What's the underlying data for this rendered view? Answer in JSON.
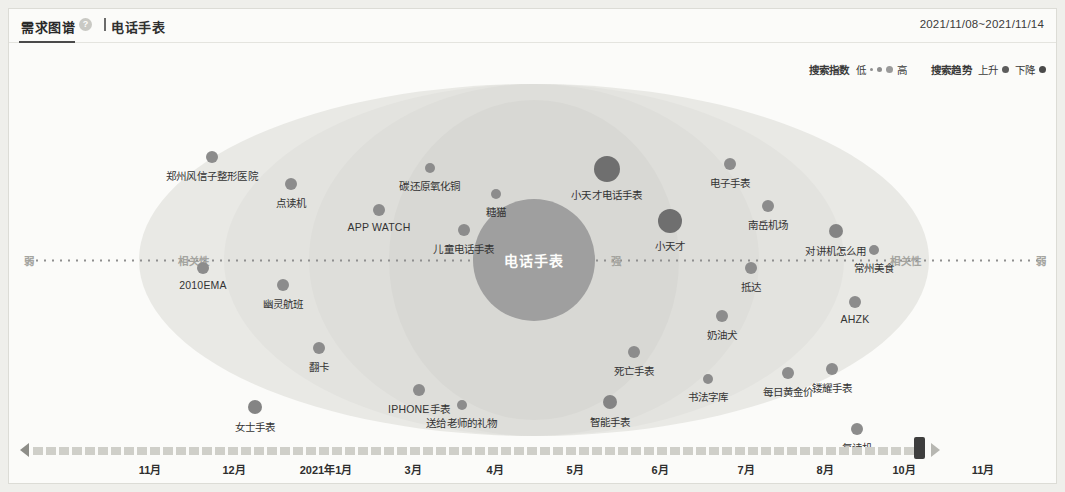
{
  "header": {
    "title": "需求图谱",
    "help_icon": "question-mark",
    "keyword": "电话手表",
    "date_range": "2021/11/08~2021/11/14"
  },
  "legend": {
    "index_title": "搜索指数",
    "index_low": "低",
    "index_high": "高",
    "trend_title": "搜索趋势",
    "trend_up": "上升",
    "trend_down": "下降"
  },
  "axis": {
    "weak_left": "弱",
    "relevance_left": "相关性",
    "strong_left": "强",
    "strong_right": "强",
    "relevance_right": "相关性",
    "weak_right": "弱"
  },
  "graph": {
    "center_label": "电话手表",
    "nodes": [
      {
        "label": "郑州风信子整形医院",
        "x": 203,
        "y": 148,
        "r": 6
      },
      {
        "label": "点读机",
        "x": 282,
        "y": 175,
        "r": 6
      },
      {
        "label": "APP WATCH",
        "x": 370,
        "y": 201,
        "r": 6
      },
      {
        "label": "碳还原氧化铜",
        "x": 421,
        "y": 159,
        "r": 5
      },
      {
        "label": "糖猫",
        "x": 487,
        "y": 185,
        "r": 5
      },
      {
        "label": "小天才电话手表",
        "x": 598,
        "y": 160,
        "r": 13
      },
      {
        "label": "电子手表",
        "x": 721,
        "y": 155,
        "r": 6
      },
      {
        "label": "儿童电话手表",
        "x": 455,
        "y": 221,
        "r": 6
      },
      {
        "label": "小天才",
        "x": 661,
        "y": 212,
        "r": 12
      },
      {
        "label": "南岳机场",
        "x": 759,
        "y": 197,
        "r": 6
      },
      {
        "label": "对讲机怎么用",
        "x": 827,
        "y": 222,
        "r": 7
      },
      {
        "label": "常州美食",
        "x": 865,
        "y": 241,
        "r": 5
      },
      {
        "label": "2010EMA",
        "x": 194,
        "y": 259,
        "r": 6
      },
      {
        "label": "抵达",
        "x": 742,
        "y": 259,
        "r": 6
      },
      {
        "label": "幽灵航班",
        "x": 274,
        "y": 276,
        "r": 6
      },
      {
        "label": "AHZK",
        "x": 846,
        "y": 293,
        "r": 6
      },
      {
        "label": "奶油犬",
        "x": 713,
        "y": 307,
        "r": 6
      },
      {
        "label": "翻卡",
        "x": 310,
        "y": 339,
        "r": 6
      },
      {
        "label": "死亡手表",
        "x": 625,
        "y": 343,
        "r": 6
      },
      {
        "label": "书法字库",
        "x": 699,
        "y": 370,
        "r": 5
      },
      {
        "label": "每日黄金价",
        "x": 779,
        "y": 364,
        "r": 6
      },
      {
        "label": "镂耀手表",
        "x": 823,
        "y": 360,
        "r": 6
      },
      {
        "label": "IPHONE手表",
        "x": 410,
        "y": 381,
        "r": 6
      },
      {
        "label": "送给老师的礼物",
        "x": 453,
        "y": 396,
        "r": 5
      },
      {
        "label": "女士手表",
        "x": 246,
        "y": 398,
        "r": 7
      },
      {
        "label": "智能手表",
        "x": 601,
        "y": 393,
        "r": 7
      },
      {
        "label": "复读机",
        "x": 848,
        "y": 420,
        "r": 6
      }
    ]
  },
  "timeline": {
    "ticks": [
      {
        "label": "11月",
        "x": 141
      },
      {
        "label": "12月",
        "x": 225
      },
      {
        "label": "2021年1月",
        "x": 317
      },
      {
        "label": "3月",
        "x": 404
      },
      {
        "label": "4月",
        "x": 486
      },
      {
        "label": "5月",
        "x": 566
      },
      {
        "label": "6月",
        "x": 651
      },
      {
        "label": "7月",
        "x": 737
      },
      {
        "label": "8月",
        "x": 816
      },
      {
        "label": "10月",
        "x": 895
      },
      {
        "label": "11月",
        "x": 974
      }
    ],
    "left_arrow": "left-arrow",
    "right_arrow": "right-arrow",
    "handle": "timeline-handle"
  }
}
